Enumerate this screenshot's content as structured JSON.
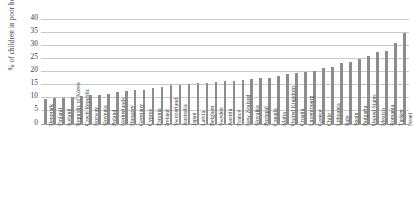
{
  "chart_data": {
    "type": "bar",
    "title": "",
    "xlabel": "",
    "ylabel": "% of children in poor households",
    "ylim": [
      0,
      40
    ],
    "yticks": [
      0,
      5,
      10,
      15,
      20,
      25,
      30,
      35,
      40
    ],
    "grid": true,
    "legend": "none",
    "bar_color": "#8d8d8d",
    "categories": [
      "Denmark",
      "Finland",
      "Iceland",
      "Republic of Korea",
      "Czech Republic",
      "Norway",
      "Slovenia",
      "Poland",
      "Netherlands",
      "Hungary",
      "Germany",
      "Cyprus",
      "Estonia",
      "Ireland",
      "Switzerland",
      "Australia",
      "Japan",
      "Latvia",
      "Belgium",
      "Sweden",
      "Austria",
      "France",
      "New Zealand",
      "Slovakia",
      "Portugal",
      "Canada",
      "Malta",
      "United Kingdom",
      "Croatia",
      "Luxembourg",
      "Greece",
      "Chile",
      "Lithuania",
      "Italy",
      "Spain",
      "Bulgaria",
      "United States",
      "Mexico",
      "Romania",
      "Turkey",
      "Israel"
    ],
    "values": [
      9.9,
      10.0,
      10.1,
      10.4,
      11.0,
      11.2,
      11.4,
      11.7,
      12.3,
      12.8,
      13.1,
      13.3,
      14.0,
      14.4,
      15.0,
      15.2,
      15.5,
      15.8,
      16.0,
      16.2,
      16.4,
      16.7,
      17.0,
      17.3,
      17.6,
      17.9,
      18.3,
      19.1,
      19.6,
      20.0,
      20.5,
      21.6,
      22.0,
      23.5,
      24.0,
      25.0,
      26.0,
      27.6,
      28.0,
      31.2,
      35.0
    ]
  }
}
